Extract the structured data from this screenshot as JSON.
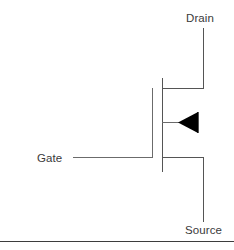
{
  "diagram": {
    "type": "circuit-schematic",
    "background_color": "#ffffff",
    "line_color": "#555555",
    "arrow_fill_color": "#000000",
    "text_color": "#3a3a3a",
    "border_color": "#3d3d3d"
  },
  "labels": {
    "drain": "Drain",
    "gate": "Gate",
    "source": "Source"
  },
  "terminals": [
    {
      "name": "drain",
      "label": "Drain",
      "position": "top-right"
    },
    {
      "name": "gate",
      "label": "Gate",
      "position": "left"
    },
    {
      "name": "source",
      "label": "Source",
      "position": "bottom-right"
    }
  ],
  "geometry": {
    "gate_bar": {
      "x": 152,
      "y1": 88,
      "y2": 157
    },
    "channel_bar": {
      "x": 162,
      "y1": 78,
      "y2": 172
    },
    "drain_stub": {
      "y": 88,
      "x1": 162,
      "x2": 203
    },
    "drain_lead": {
      "x": 203,
      "y1": 28,
      "y2": 88
    },
    "gate_lead": {
      "y": 157,
      "x1": 73,
      "x2": 152
    },
    "source_stub": {
      "y": 157,
      "x1": 162,
      "x2": 203
    },
    "source_lead": {
      "x": 203,
      "y1": 157,
      "y2": 222
    },
    "arrow_stub": {
      "y": 122,
      "x1": 162,
      "x2": 180
    },
    "arrow_triangle": {
      "tip_x": 178,
      "base_x": 198,
      "y_top": 112,
      "y_bottom": 133
    },
    "arrow_tail": {
      "x": 198,
      "y1": 112,
      "y2": 133
    },
    "bottom_border": {
      "y": 241,
      "x1": 0,
      "x2": 234
    }
  }
}
